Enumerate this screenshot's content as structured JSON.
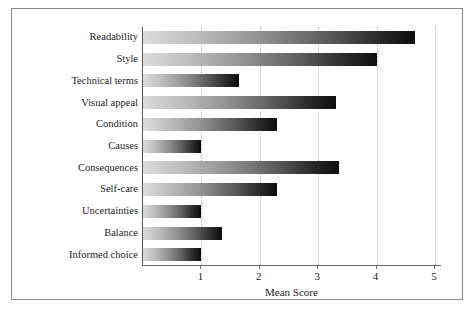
{
  "chart_data": {
    "type": "bar",
    "orientation": "horizontal",
    "title": "",
    "xlabel": "Mean Score",
    "ylabel": "",
    "categories": [
      "Readability",
      "Style",
      "Technical terms",
      "Visual appeal",
      "Condition",
      "Causes",
      "Consequences",
      "Self-care",
      "Uncertainties",
      "Balance",
      "Informed choice"
    ],
    "values": [
      4.65,
      4.0,
      1.65,
      3.3,
      2.3,
      1.0,
      3.35,
      2.3,
      1.0,
      1.35,
      1.0
    ],
    "xlim": [
      0,
      5.12
    ],
    "xticks": [
      1,
      2,
      3,
      4,
      5
    ],
    "xticklabels": [
      "1",
      "2",
      "3",
      "4",
      "5"
    ],
    "grid": "vertical-dotted",
    "legend": "none",
    "bar_style": {
      "gradient_start_color": "#dcdcdc",
      "gradient_end_color": "#0d0d0d",
      "gridline_color": "#b6b6b6",
      "axis_color": "#6a6a6a",
      "frame_color": "#8a8a8a",
      "text_color": "#1c1c1c",
      "background_color": "#ffffff"
    }
  }
}
